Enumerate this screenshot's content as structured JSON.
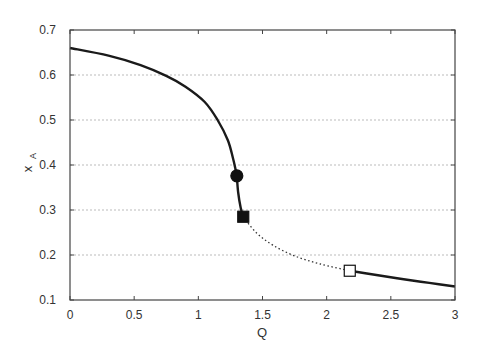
{
  "chart_data": {
    "type": "line",
    "title": "",
    "xlabel": "Q",
    "ylabel": "x",
    "ylabel_subscript": "A",
    "xlim": [
      0,
      3
    ],
    "ylim": [
      0.1,
      0.7
    ],
    "xticks": [
      0,
      0.5,
      1,
      1.5,
      2,
      2.5,
      3
    ],
    "xtick_labels": [
      "0",
      "0.5",
      "1",
      "1.5",
      "2",
      "2.5",
      "3"
    ],
    "yticks": [
      0.1,
      0.2,
      0.3,
      0.4,
      0.5,
      0.6,
      0.7
    ],
    "ytick_labels": [
      "0.1",
      "0.2",
      "0.3",
      "0.4",
      "0.5",
      "0.6",
      "0.7"
    ],
    "grid": "horizontal dotted",
    "legend": null,
    "series": [
      {
        "name": "stable upper branch",
        "style": "solid",
        "color": "#1a1a1a",
        "points": [
          [
            0,
            0.66
          ],
          [
            0.3,
            0.643
          ],
          [
            0.55,
            0.622
          ],
          [
            0.75,
            0.598
          ],
          [
            0.9,
            0.574
          ],
          [
            1.05,
            0.54
          ],
          [
            1.15,
            0.5
          ],
          [
            1.23,
            0.455
          ],
          [
            1.27,
            0.415
          ],
          [
            1.29,
            0.39
          ],
          [
            1.3,
            0.376
          ]
        ]
      },
      {
        "name": "stable branch (circle to square)",
        "style": "solid",
        "color": "#1a1a1a",
        "points": [
          [
            1.3,
            0.376
          ],
          [
            1.31,
            0.34
          ],
          [
            1.33,
            0.305
          ],
          [
            1.35,
            0.285
          ]
        ]
      },
      {
        "name": "unstable branch",
        "style": "dotted",
        "color": "#333333",
        "points": [
          [
            1.35,
            0.285
          ],
          [
            1.45,
            0.25
          ],
          [
            1.58,
            0.222
          ],
          [
            1.75,
            0.198
          ],
          [
            1.95,
            0.18
          ],
          [
            2.18,
            0.165
          ]
        ]
      },
      {
        "name": "stable lower branch",
        "style": "solid",
        "color": "#1a1a1a",
        "points": [
          [
            2.18,
            0.165
          ],
          [
            2.4,
            0.155
          ],
          [
            2.6,
            0.146
          ],
          [
            2.8,
            0.138
          ],
          [
            3.0,
            0.13
          ]
        ]
      }
    ],
    "markers": [
      {
        "name": "filled-circle",
        "shape": "circle",
        "filled": true,
        "x": 1.3,
        "y": 0.376
      },
      {
        "name": "filled-square",
        "shape": "square",
        "filled": true,
        "x": 1.35,
        "y": 0.285
      },
      {
        "name": "open-square",
        "shape": "square",
        "filled": false,
        "x": 2.18,
        "y": 0.165
      }
    ]
  },
  "labels": {
    "x_axis": "Q",
    "y_axis_main": "x",
    "y_axis_sub": "A"
  }
}
